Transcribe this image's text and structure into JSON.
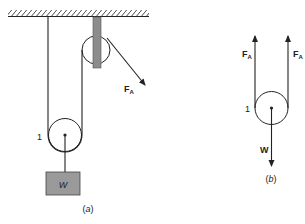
{
  "figure_a": {
    "caption": "(a)",
    "pulley_label": "1",
    "weight_label": "W",
    "force_label_main": "F",
    "force_label_sub": "A"
  },
  "figure_b": {
    "caption": "(b)",
    "pulley_label": "1",
    "weight_force_label": "W",
    "left_force_main": "F",
    "left_force_sub": "A",
    "right_force_main": "F",
    "right_force_sub": "A"
  },
  "colors": {
    "line": "#222222",
    "bracket": "#8c8c8c",
    "weight_box": "#9a9a9a"
  }
}
